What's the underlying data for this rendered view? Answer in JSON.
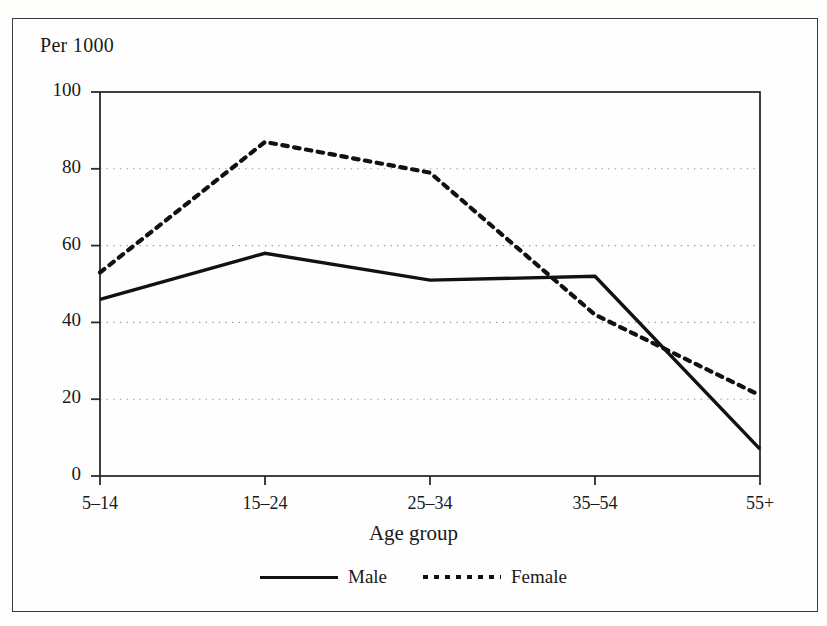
{
  "chart_data": {
    "type": "line",
    "title": "",
    "ylabel": "Per 1000",
    "xlabel": "Age group",
    "categories": [
      "5–14",
      "15–24",
      "25–34",
      "35–54",
      "55+"
    ],
    "series": [
      {
        "name": "Male",
        "style": "solid",
        "color": "#111111",
        "values": [
          46,
          58,
          51,
          52,
          7
        ]
      },
      {
        "name": "Female",
        "style": "dotted",
        "color": "#111111",
        "values": [
          53,
          87,
          79,
          42,
          21
        ]
      }
    ],
    "ylim": [
      0,
      100
    ],
    "yticks": [
      0,
      20,
      40,
      60,
      80,
      100
    ],
    "ytick_labels": [
      "0",
      "20",
      "40",
      "60",
      "80",
      "100"
    ],
    "grid": "horizontal-dotted",
    "legend_position": "bottom-center"
  },
  "axes": {
    "y_unit_label": "Per 1000",
    "x_axis_title": "Age group"
  },
  "legend": {
    "entries": [
      {
        "label": "Male",
        "style": "solid"
      },
      {
        "label": "Female",
        "style": "dotted"
      }
    ]
  }
}
